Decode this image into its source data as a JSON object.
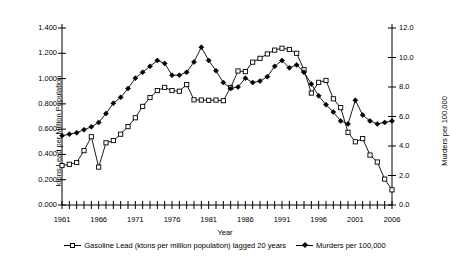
{
  "chart_data": {
    "type": "line",
    "title": "",
    "xlabel": "Year",
    "ylabel_left": "ktons Lead per Million Population",
    "ylabel_right": "Murders per 100,000",
    "grid": false,
    "legend_position": "bottom",
    "xlim": [
      1961,
      2006
    ],
    "xticks": [
      1961,
      1966,
      1971,
      1976,
      1981,
      1986,
      1991,
      1996,
      2001,
      2006
    ],
    "xtick_labels": [
      "1961",
      "1966",
      "1971",
      "1976",
      "1981",
      "1986",
      "1991",
      "1996",
      "2001",
      "2006"
    ],
    "ylim_left": [
      0.0,
      1.4
    ],
    "yticks_left": [
      0.0,
      0.2,
      0.4,
      0.6,
      0.8,
      1.0,
      1.2,
      1.4
    ],
    "ytick_labels_left": [
      "0.000",
      "0.200",
      "0.400",
      "0.600",
      "0.800",
      "1.000",
      "1.200",
      "1.400"
    ],
    "ylim_right": [
      0.0,
      12.0
    ],
    "yticks_right": [
      0.0,
      2.0,
      4.0,
      6.0,
      8.0,
      10.0,
      12.0
    ],
    "ytick_labels_right": [
      "0.0",
      "2.0",
      "4.0",
      "6.0",
      "8.0",
      "10.0",
      "12.0"
    ],
    "x": [
      1961,
      1962,
      1963,
      1964,
      1965,
      1966,
      1967,
      1968,
      1969,
      1970,
      1971,
      1972,
      1973,
      1974,
      1975,
      1976,
      1977,
      1978,
      1979,
      1980,
      1981,
      1982,
      1983,
      1984,
      1985,
      1986,
      1987,
      1988,
      1989,
      1990,
      1991,
      1992,
      1993,
      1994,
      1995,
      1996,
      1997,
      1998,
      1999,
      2000,
      2001,
      2002,
      2003,
      2004,
      2005,
      2006
    ],
    "series": [
      {
        "name": "Gasoline Lead (ktons per million population) lagged 20 years",
        "axis": "left",
        "marker": "open-square",
        "values": [
          0.312,
          0.322,
          0.336,
          0.43,
          0.54,
          0.3,
          0.492,
          0.51,
          0.56,
          0.62,
          0.69,
          0.78,
          0.85,
          0.905,
          0.93,
          0.905,
          0.9,
          0.952,
          0.832,
          0.83,
          0.828,
          0.83,
          0.825,
          0.93,
          1.06,
          1.055,
          1.13,
          1.16,
          1.195,
          1.225,
          1.24,
          1.23,
          1.2,
          1.07,
          0.885,
          0.97,
          0.985,
          0.84,
          0.77,
          0.575,
          0.5,
          0.525,
          0.395,
          0.34,
          0.205,
          0.12
        ]
      },
      {
        "name": "Murders per 100,000",
        "axis": "right",
        "marker": "filled-diamond",
        "values": [
          4.7,
          4.8,
          4.9,
          5.1,
          5.3,
          5.6,
          6.2,
          6.9,
          7.3,
          7.9,
          8.6,
          9.0,
          9.4,
          9.8,
          9.6,
          8.8,
          8.8,
          9.0,
          9.7,
          10.7,
          9.8,
          9.1,
          8.3,
          7.9,
          8.0,
          8.6,
          8.3,
          8.4,
          8.7,
          9.4,
          9.8,
          9.3,
          9.5,
          9.0,
          8.2,
          7.4,
          6.8,
          6.3,
          5.7,
          5.5,
          7.1,
          6.1,
          5.7,
          5.5,
          5.6,
          5.7
        ]
      }
    ]
  }
}
